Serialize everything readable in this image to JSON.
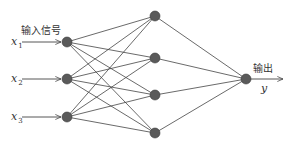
{
  "diagram": {
    "type": "neural-network",
    "input_label": "输入信号",
    "output_label": "输出",
    "output_var": "y",
    "inputs": [
      {
        "var": "x",
        "sub": "1"
      },
      {
        "var": "x",
        "sub": "2"
      },
      {
        "var": "x",
        "sub": "3"
      }
    ],
    "layers": {
      "input_nodes": 3,
      "hidden_nodes": 4,
      "output_nodes": 1
    },
    "colors": {
      "node_fill": "#5a5a5a",
      "line": "#444444",
      "text": "#333333"
    }
  }
}
